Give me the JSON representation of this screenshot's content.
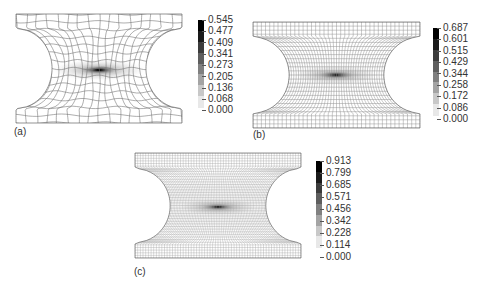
{
  "figure": {
    "panels": [
      {
        "id": "a",
        "label": "(a)",
        "description": "Coarse quadrilateral mesh of notched specimen with stress contour",
        "mesh_density": "coarse",
        "colorbar": {
          "ticks": [
            "0.545",
            "0.477",
            "0.409",
            "0.341",
            "0.273",
            "0.205",
            "0.136",
            "0.068",
            "0.000"
          ],
          "max": 0.545,
          "min": 0.0
        }
      },
      {
        "id": "b",
        "label": "(b)",
        "description": "Medium quadrilateral mesh of notched specimen with stress contour",
        "mesh_density": "medium",
        "colorbar": {
          "ticks": [
            "0.687",
            "0.601",
            "0.515",
            "0.429",
            "0.344",
            "0.258",
            "0.172",
            "0.086",
            "0.000"
          ],
          "max": 0.687,
          "min": 0.0
        }
      },
      {
        "id": "c",
        "label": "(c)",
        "description": "Fine quadrilateral mesh of notched specimen with stress contour",
        "mesh_density": "fine",
        "colorbar": {
          "ticks": [
            "0.913",
            "0.799",
            "0.685",
            "0.571",
            "0.456",
            "0.342",
            "0.228",
            "0.114",
            "0.000"
          ],
          "max": 0.913,
          "min": 0.0
        }
      }
    ],
    "colorbar_shades": [
      "#000000",
      "#1a1a1a",
      "#3c3c3c",
      "#5e5e5e",
      "#808080",
      "#a4a4a4",
      "#c8c8c8",
      "#e8e8e8"
    ]
  }
}
